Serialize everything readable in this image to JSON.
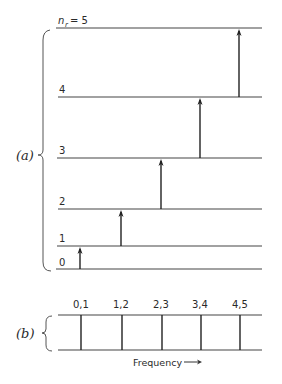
{
  "figure": {
    "part_a": {
      "label": "(a)",
      "level_symbol": "n",
      "level_subscript": "r",
      "levels": [
        {
          "n": 0,
          "label": "0",
          "y": 269
        },
        {
          "n": 1,
          "label": "1",
          "y": 246
        },
        {
          "n": 2,
          "label": "2",
          "y": 209
        },
        {
          "n": 3,
          "label": "3",
          "y": 158
        },
        {
          "n": 4,
          "label": "4",
          "y": 97
        },
        {
          "n": 5,
          "label": "= 5",
          "y": 28
        }
      ],
      "transitions": [
        {
          "from": 0,
          "to": 1,
          "x": 80
        },
        {
          "from": 1,
          "to": 2,
          "x": 121
        },
        {
          "from": 2,
          "to": 3,
          "x": 161
        },
        {
          "from": 3,
          "to": 4,
          "x": 200
        },
        {
          "from": 4,
          "to": 5,
          "x": 239
        }
      ]
    },
    "part_b": {
      "label": "(b)",
      "lines": [
        {
          "label": "0,1",
          "x": 81
        },
        {
          "label": "1,2",
          "x": 122
        },
        {
          "label": "2,3",
          "x": 162
        },
        {
          "label": "3,4",
          "x": 201
        },
        {
          "label": "4,5",
          "x": 240
        }
      ],
      "axis_label": "Frequency",
      "axis_arrow": "→"
    }
  }
}
